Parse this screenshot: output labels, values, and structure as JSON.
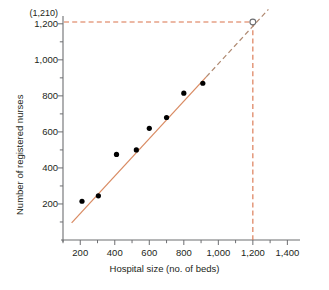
{
  "chart_data": {
    "type": "scatter",
    "title": "",
    "xlabel": "Hospital size (no. of beds)",
    "ylabel": "Number of registered nurses",
    "xlim": [
      100,
      1450
    ],
    "ylim": [
      0,
      1260
    ],
    "grid": false,
    "legend": "none",
    "xticks": [
      200,
      400,
      600,
      800,
      1000,
      1200,
      1400
    ],
    "xtick_labels": [
      "200",
      "400",
      "600",
      "800",
      "1,000",
      "1,200",
      "1,400"
    ],
    "xminor_step": 100,
    "yticks": [
      200,
      400,
      600,
      800,
      1000,
      1200
    ],
    "ytick_labels": [
      "200",
      "400",
      "600",
      "800",
      "1,000",
      "1,200"
    ],
    "yminor_step": 100,
    "points": [
      {
        "x": 210,
        "y": 215
      },
      {
        "x": 305,
        "y": 245
      },
      {
        "x": 410,
        "y": 475
      },
      {
        "x": 525,
        "y": 500
      },
      {
        "x": 600,
        "y": 620
      },
      {
        "x": 700,
        "y": 680
      },
      {
        "x": 800,
        "y": 815
      },
      {
        "x": 910,
        "y": 870
      }
    ],
    "series": [
      {
        "name": "regression-line",
        "style": "solid",
        "color": "#d98b63",
        "x": [
          150,
          930
        ],
        "y": [
          95,
          905
        ]
      },
      {
        "name": "regression-line-extrapolated",
        "style": "dashed",
        "color": "#b08a72",
        "x": [
          930,
          1290
        ],
        "y": [
          905,
          1280
        ]
      }
    ],
    "annotations": [
      {
        "name": "extrapolated-point",
        "marker": "open-circle",
        "x": 1200,
        "y": 1210,
        "label": "(1,210)",
        "guide_lines": [
          "horizontal-to-y-axis",
          "vertical-to-x-axis"
        ],
        "guide_color": "#d9724a"
      }
    ]
  },
  "axes": {
    "x_title": "Hospital size (no. of beds)",
    "y_title": "Number of registered nurses"
  },
  "labels": {
    "extrapolation_value": "(1,210)"
  },
  "colors": {
    "line": "#d98b63",
    "dashed_line": "#b08a72",
    "guide": "#d9724a",
    "point": "#000000",
    "axis": "#6d6e71",
    "text": "#231f20"
  }
}
